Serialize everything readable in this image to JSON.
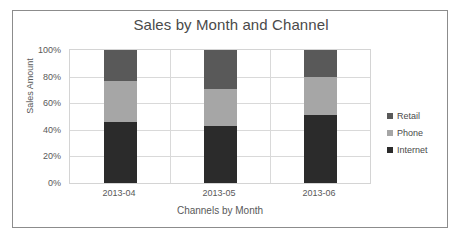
{
  "chart_data": {
    "type": "bar",
    "subtype": "stacked-percent",
    "title": "Sales by Month and Channel",
    "xlabel": "Channels by Month",
    "ylabel": "Sales Amount",
    "categories": [
      "2013-04",
      "2013-05",
      "2013-06"
    ],
    "series": [
      {
        "name": "Internet",
        "values": [
          46,
          43,
          51
        ],
        "color": "#2b2b2b"
      },
      {
        "name": "Phone",
        "values": [
          31,
          28,
          29
        ],
        "color": "#a6a6a6"
      },
      {
        "name": "Retail",
        "values": [
          23,
          29,
          20
        ],
        "color": "#595959"
      }
    ],
    "stack_order_bottom_to_top": [
      "Internet",
      "Phone",
      "Retail"
    ],
    "ylim": [
      0,
      100
    ],
    "yticks": [
      "0%",
      "20%",
      "40%",
      "60%",
      "80%",
      "100%"
    ],
    "ytick_values": [
      0,
      20,
      40,
      60,
      80,
      100
    ],
    "grid": true,
    "legend_position": "right",
    "legend": [
      "Retail",
      "Phone",
      "Internet"
    ]
  },
  "colors": {
    "frame_border": "#8c8c8c",
    "plot_border": "#d4d4d4",
    "gridline": "#d9d9d9",
    "title_text": "#4a4a4a",
    "axis_text": "#595959",
    "background": "#ffffff"
  }
}
